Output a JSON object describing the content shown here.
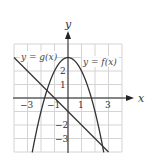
{
  "chart_data": {
    "type": "line",
    "title": "",
    "xlabel": "x",
    "ylabel": "y",
    "xlim": [
      -4,
      4
    ],
    "ylim": [
      -4,
      4
    ],
    "grid": true,
    "x_tick_labels": [
      "-3",
      "-1",
      "1",
      "3"
    ],
    "x_ticks": [
      -3,
      -1,
      1,
      3
    ],
    "y_tick_labels": [
      "2",
      "1",
      "-2",
      "-3"
    ],
    "y_ticks": [
      2,
      1,
      -2,
      -3
    ],
    "series": [
      {
        "name": "f",
        "label": "y = f(x)",
        "formula": "f(x) = 3 - x^2",
        "x": [
          -2.65,
          -2,
          -1.5,
          -1,
          -0.5,
          0,
          0.5,
          1,
          1.5,
          2,
          2.65
        ],
        "values": [
          -4.02,
          -1,
          0.75,
          2,
          2.75,
          3,
          2.75,
          2,
          0.75,
          -1,
          -4.02
        ]
      },
      {
        "name": "g",
        "label": "y = g(x)",
        "formula": "g(x) = -x - 1",
        "x": [
          -4,
          3
        ],
        "values": [
          3,
          -4
        ]
      }
    ],
    "annotations": [
      "y = g(x)",
      "y = f(x)"
    ]
  },
  "labels": {
    "x_axis": "x",
    "y_axis": "y",
    "f_label": "y = f(x)",
    "g_label": "y = g(x)",
    "ticks": {
      "xm3": "−3",
      "xm1": "−1",
      "x1": "1",
      "x3": "3",
      "y2": "2",
      "y1": "1",
      "ym2": "−2",
      "ym3": "−3"
    }
  },
  "colors": {
    "grid": "#d4d4d4",
    "axis": "#222222",
    "curve": "#333333",
    "background": "#ffffff"
  }
}
